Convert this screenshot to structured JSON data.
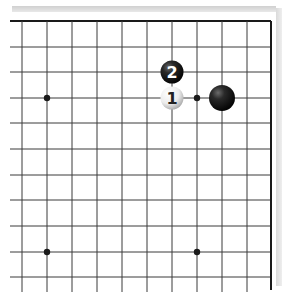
{
  "board": {
    "description": "Go board corner diagram (top-right area)",
    "grid_color": "#3a3a3a",
    "edge_color": "#1a1a1a",
    "background": "#ffffff",
    "columns_x": [
      22,
      47,
      72,
      97,
      122,
      147,
      172,
      197,
      222,
      247,
      271
    ],
    "rows_y": [
      21,
      47,
      72,
      98,
      123,
      149,
      175,
      200,
      226,
      252,
      277
    ],
    "hoshi": [
      {
        "x": 47,
        "y": 98
      },
      {
        "x": 197,
        "y": 98
      },
      {
        "x": 47,
        "y": 252
      },
      {
        "x": 197,
        "y": 252
      }
    ]
  },
  "stones": [
    {
      "color": "black",
      "label": "2",
      "x": 172,
      "y": 72,
      "size": "small"
    },
    {
      "color": "white",
      "label": "1",
      "x": 172,
      "y": 98,
      "size": "small"
    },
    {
      "color": "black",
      "label": "",
      "x": 222,
      "y": 98,
      "size": "large"
    }
  ]
}
